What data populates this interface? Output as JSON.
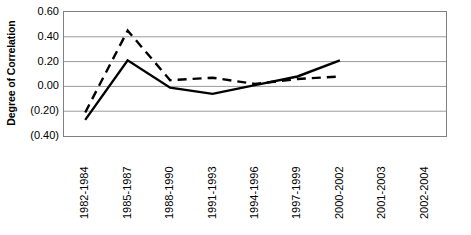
{
  "chart_data": {
    "type": "line",
    "title": "",
    "xlabel": "",
    "ylabel": "Degree of Correlation",
    "categories": [
      "1982-1984",
      "1985-1987",
      "1988-1990",
      "1991-1993",
      "1994-1996",
      "1997-1999",
      "2000-2002",
      "2001-2003",
      "2002-2004"
    ],
    "ytick_labels": [
      "0.60",
      "0.40",
      "0.20",
      "0.00",
      "(0.20)",
      "(0.40)"
    ],
    "ytick_values": [
      0.6,
      0.4,
      0.2,
      0.0,
      -0.2,
      -0.4
    ],
    "ylim": [
      -0.4,
      0.6
    ],
    "grid": true,
    "legend": "none",
    "series": [
      {
        "name": "solid-series",
        "style": "solid",
        "color": "#000000",
        "values": [
          -0.27,
          0.21,
          -0.01,
          -0.06,
          0.01,
          0.08,
          0.21,
          null,
          null
        ]
      },
      {
        "name": "dashed-series",
        "style": "dashed",
        "color": "#000000",
        "values": [
          -0.21,
          0.45,
          0.05,
          0.07,
          0.02,
          0.06,
          0.08,
          null,
          null
        ]
      }
    ]
  }
}
